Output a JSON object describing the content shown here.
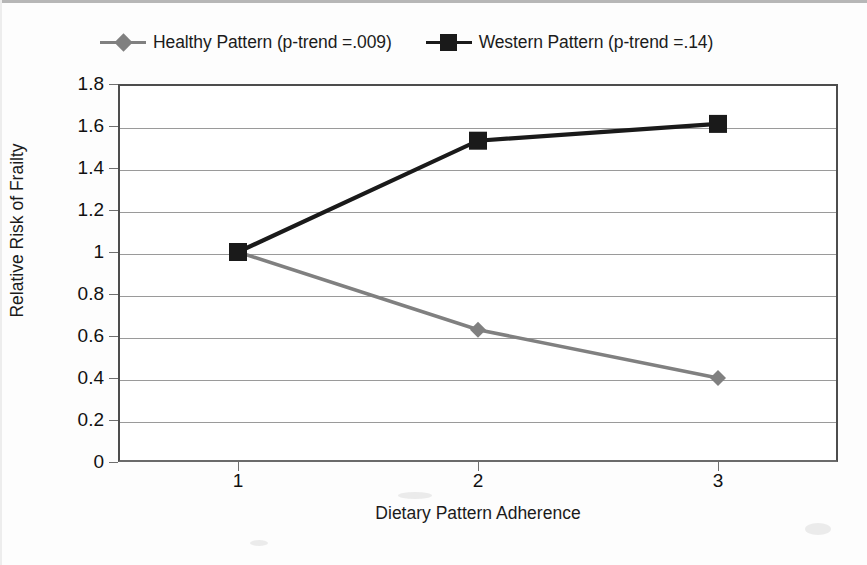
{
  "chart_data": {
    "type": "line",
    "title": "",
    "xlabel": "Dietary Pattern Adherence",
    "ylabel": "Relative Risk of Frailty",
    "x": [
      1,
      2,
      3
    ],
    "categories": [
      "1",
      "2",
      "3"
    ],
    "xlim": [
      0.5,
      3.5
    ],
    "ylim": [
      0,
      1.8
    ],
    "ytick_labels": [
      "1.8",
      "1.6",
      "1.4",
      "1.2",
      "1",
      "0.8",
      "0.6",
      "0.4",
      "0.2",
      "0"
    ],
    "ytick_values": [
      1.8,
      1.6,
      1.4,
      1.2,
      1.0,
      0.8,
      0.6,
      0.4,
      0.2,
      0.0
    ],
    "grid": true,
    "grid_axis": "y",
    "legend_position": "top",
    "series": [
      {
        "name": "Healthy Pattern (p-trend =.009)",
        "values": [
          1.0,
          0.63,
          0.4
        ],
        "color": "#808080",
        "marker": "diamond"
      },
      {
        "name": "Western Pattern (p-trend =.14)",
        "values": [
          1.0,
          1.53,
          1.61
        ],
        "color": "#1a1a1a",
        "marker": "square"
      }
    ]
  },
  "legend": {
    "entries": [
      {
        "label": "Healthy Pattern (p-trend =.009)",
        "marker": "diamond-marker",
        "color": "#808080"
      },
      {
        "label": "Western Pattern (p-trend =.14)",
        "marker": "square-marker",
        "color": "#1a1a1a"
      }
    ]
  },
  "axes": {
    "x_title": "Dietary Pattern Adherence",
    "y_title": "Relative Risk of Frailty",
    "x_tick_labels": [
      "1",
      "2",
      "3"
    ],
    "y_tick_labels": [
      "1.8",
      "1.6",
      "1.4",
      "1.2",
      "1",
      "0.8",
      "0.6",
      "0.4",
      "0.2",
      "0"
    ]
  },
  "colors": {
    "healthy_series": "#808080",
    "western_series": "#1a1a1a",
    "gridline": "#9a9a9a",
    "axis": "#4d4d4d",
    "background": "#ffffff"
  }
}
